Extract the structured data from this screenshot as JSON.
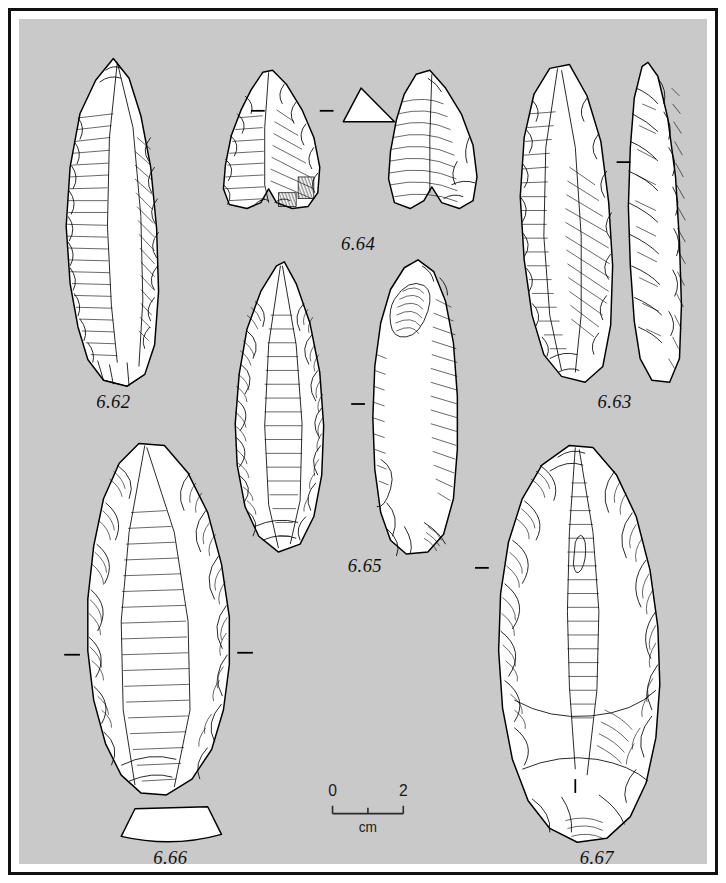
{
  "plate": {
    "background_color": "#c9c9c9",
    "border_color": "#111111",
    "mat_color": "#ffffff",
    "ink_color": "#000000",
    "artifact_fill": "#ffffff"
  },
  "scale": {
    "start_label": "0",
    "end_label": "2",
    "unit_label": "cm"
  },
  "figures": [
    {
      "id": "6.62",
      "label": "6.62",
      "description": "elongated pointed blade, single dorsal view with parallel ripple hatching and scalloped retouch along left margin",
      "views": 1,
      "has_section": false,
      "section_ticks": 0
    },
    {
      "id": "6.63",
      "label": "6.63",
      "description": "elongated retouched point shown in face view and narrow lateral edge view",
      "views": 2,
      "has_section": false,
      "section_ticks": 1
    },
    {
      "id": "6.64",
      "label": "6.64",
      "description": "notched tanged point, dorsal and ventral views with triangular cross-section",
      "views": 2,
      "has_section": true,
      "section_shape": "triangular",
      "section_ticks": 2
    },
    {
      "id": "6.65",
      "label": "6.65",
      "description": "bifacial foliate point, dorsal face with invasive flake scars and ventral face with bulb of percussion",
      "views": 2,
      "has_section": false,
      "section_ticks": 1
    },
    {
      "id": "6.66",
      "label": "6.66",
      "description": "large pointed flake with steep retouch, trapezoidal cross-section drawn below",
      "views": 1,
      "has_section": true,
      "section_shape": "trapezoidal",
      "section_ticks": 2
    },
    {
      "id": "6.67",
      "label": "6.67",
      "description": "large bifacial handaxe with radial flake scars and plain cortical base",
      "views": 1,
      "has_section": false,
      "section_ticks": 2
    }
  ]
}
